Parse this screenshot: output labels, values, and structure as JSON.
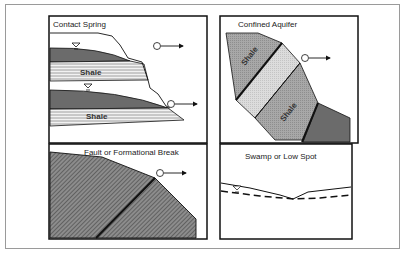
{
  "figure": {
    "panels": [
      {
        "id": "contact-spring",
        "title": "Contact Spring",
        "layer_labels": [
          "Shale",
          "Shale"
        ]
      },
      {
        "id": "confined-aquifer",
        "title": "Confined Aquifer",
        "layer_labels": [
          "Shale",
          "Shale"
        ]
      },
      {
        "id": "fault",
        "title": "Fault or Formational Break",
        "layer_labels": []
      },
      {
        "id": "swamp",
        "title": "Swamp or Low Spot",
        "layer_labels": []
      }
    ],
    "colors": {
      "dark_layer": "#6b6b6b",
      "medium_layer": "#a8a8a8",
      "light_layer": "#d9d9d9",
      "outline": "#1a1a1a",
      "frame": "#9a9a9a"
    }
  }
}
